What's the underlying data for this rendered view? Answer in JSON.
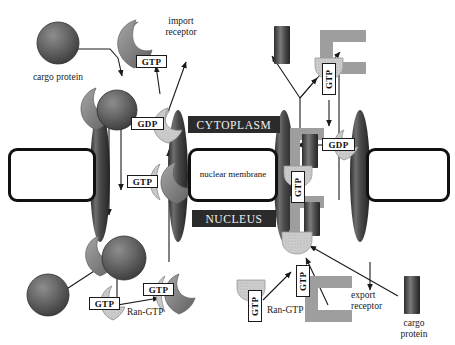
{
  "figure": {
    "compartments": {
      "cytoplasm_label": "CYTOPLASM",
      "nucleus_label": "NUCLEUS",
      "membrane_label": "nuclear membrane"
    },
    "legend_labels": {
      "cargo_protein_top_left": "cargo protein",
      "import_receptor": "import\nreceptor",
      "ran_gtp_bottom_left": "Ran-GTP",
      "ran_gtp_bottom_right": "Ran-GTP",
      "export_receptor": "export\nreceptor",
      "cargo_protein_bottom_right": "cargo\nprotein"
    },
    "legend_lines": {
      "import_receptor_l1": "import",
      "import_receptor_l2": "receptor",
      "export_receptor_l1": "export",
      "export_receptor_l2": "receptor",
      "cargo_protein_l1": "cargo",
      "cargo_protein_l2": "protein"
    },
    "nucleotide_tags": {
      "gtp": "GTP",
      "gdp": "GDP"
    },
    "tag_instances": [
      {
        "id": "gtp-import-top",
        "text": "GTP",
        "orient": "horizontal",
        "x": 136,
        "y": 55,
        "w": 31,
        "h": 13
      },
      {
        "id": "gdp-import-left",
        "text": "GDP",
        "orient": "horizontal",
        "x": 131,
        "y": 117,
        "w": 33,
        "h": 13
      },
      {
        "id": "gtp-import-pore",
        "text": "GTP",
        "orient": "horizontal",
        "x": 127,
        "y": 175,
        "w": 31,
        "h": 13
      },
      {
        "id": "gtp-ran-left",
        "text": "GTP",
        "orient": "horizontal",
        "x": 89,
        "y": 297,
        "w": 31,
        "h": 13
      },
      {
        "id": "gtp-ran-left2",
        "text": "GTP",
        "orient": "horizontal",
        "x": 143,
        "y": 283,
        "w": 31,
        "h": 13
      },
      {
        "id": "gtp-export-top",
        "text": "GTP",
        "orient": "vertical",
        "x": 322,
        "y": 63,
        "w": 14,
        "h": 32
      },
      {
        "id": "gdp-export-right",
        "text": "GDP",
        "orient": "horizontal",
        "x": 322,
        "y": 138,
        "w": 33,
        "h": 13
      },
      {
        "id": "gtp-export-pore",
        "text": "GTP",
        "orient": "vertical",
        "x": 291,
        "y": 171,
        "w": 14,
        "h": 32
      },
      {
        "id": "gtp-export-nuc",
        "text": "GTP",
        "orient": "vertical",
        "x": 296,
        "y": 265,
        "w": 14,
        "h": 32
      },
      {
        "id": "gtp-ran-bottom",
        "text": "GTP",
        "orient": "vertical",
        "x": 248,
        "y": 290,
        "w": 14,
        "h": 32
      }
    ],
    "colors": {
      "cargo_dark": "#5a5a5a",
      "cargo_dark_edge": "#2f2f2f",
      "receptor_mid_gray": "#8e8e8e",
      "export_receptor_gray": "#9c9c9c",
      "ran_light_gray": "#c9c9c9",
      "pore_dark": "#3a3a3a",
      "banner_bg": "#2b2b2b",
      "banner_text": "#f2f2f2",
      "membrane_border": "#111111",
      "arrow": "#1a1a1a",
      "background": "#ffffff"
    },
    "diagram_elements": {
      "import_side": "left",
      "export_side": "right",
      "pore_count": 4,
      "arrow_count": 16
    }
  }
}
